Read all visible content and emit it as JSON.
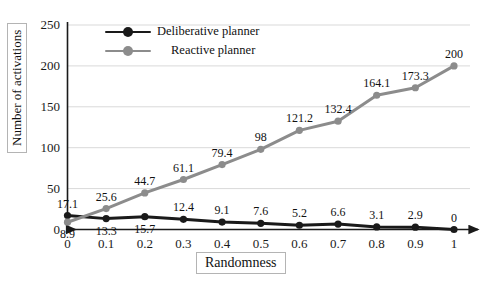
{
  "chart_data": {
    "type": "line",
    "title": "",
    "xlabel": "Randomness",
    "ylabel": "Number of activations",
    "x": [
      0,
      0.1,
      0.2,
      0.3,
      0.4,
      0.5,
      0.6,
      0.7,
      0.8,
      0.9,
      1
    ],
    "xtick_labels": [
      "0",
      "0.1",
      "0.2",
      "0.3",
      "0.4",
      "0.5",
      "0.6",
      "0.7",
      "0.8",
      "0.9",
      "1"
    ],
    "ytick_labels": [
      "0",
      "50",
      "100",
      "150",
      "200",
      "250"
    ],
    "yticks": [
      0,
      50,
      100,
      150,
      200,
      250
    ],
    "xlim": [
      0,
      1
    ],
    "ylim": [
      0,
      250
    ],
    "grid": "horizontal",
    "legend_position": "top-left-inside",
    "series": [
      {
        "name": "Deliberative planner",
        "color": "#1a1a1a",
        "marker": "circle",
        "values": [
          17.1,
          13.3,
          15.7,
          12.4,
          9.1,
          7.6,
          5.2,
          6.6,
          3.1,
          2.9,
          0
        ],
        "data_labels": [
          "17.1",
          "13.3",
          "15.7",
          "12.4",
          "9.1",
          "7.6",
          "5.2",
          "6.6",
          "3.1",
          "2.9",
          "0"
        ],
        "label_placement": [
          "above",
          "below",
          "below",
          "above",
          "above",
          "above",
          "above",
          "above",
          "above",
          "above",
          "above"
        ]
      },
      {
        "name": "Reactive planner",
        "color": "#8c8c8c",
        "marker": "circle",
        "values": [
          8.9,
          25.6,
          44.7,
          61.1,
          79.4,
          98,
          121.2,
          132.4,
          164.1,
          173.3,
          200
        ],
        "data_labels": [
          "8.9",
          "25.6",
          "44.7",
          "61.1",
          "79.4",
          "98",
          "121.2",
          "132.4",
          "164.1",
          "173.3",
          "200"
        ],
        "label_placement": [
          "below",
          "above",
          "above",
          "above",
          "above",
          "above",
          "above",
          "above",
          "above",
          "above",
          "above"
        ]
      }
    ],
    "axis_color": "#1a1a1a",
    "grid_color": "#d9d9d9",
    "background": "#ffffff"
  }
}
